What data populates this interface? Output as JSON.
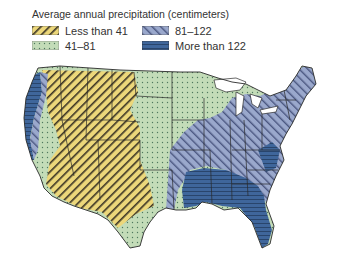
{
  "legend": {
    "title": "Average annual precipitation (centimeters)",
    "items": [
      {
        "label": "Less than 41",
        "color": "#ecd77a",
        "pattern": "diagonal-hatch-dark"
      },
      {
        "label": "81–122",
        "color": "#9aa8cc",
        "pattern": "diagonal-hatch-blue"
      },
      {
        "label": "41–81",
        "color": "#c3dcb8",
        "pattern": "dots"
      },
      {
        "label": "More than 122",
        "color": "#3f669b",
        "pattern": "horizontal-lines"
      }
    ]
  },
  "map": {
    "subject": "Contiguous United States",
    "zones": [
      "Less than 41",
      "41–81",
      "81–122",
      "More than 122"
    ]
  }
}
